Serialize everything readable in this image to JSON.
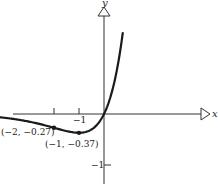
{
  "chart_data": {
    "type": "line",
    "title": "",
    "function": "y = x e^x",
    "xlabel": "x",
    "ylabel": "y",
    "x_ticks": [
      {
        "value": -2,
        "label": ""
      },
      {
        "value": -1,
        "label": "−1"
      }
    ],
    "y_ticks": [
      {
        "value": -1,
        "label": "−1"
      }
    ],
    "xlim": [
      -4.2,
      4.4
    ],
    "ylim": [
      -1.4,
      2.2
    ],
    "grid": false,
    "series": [
      {
        "name": "y = x e^x",
        "x": [
          -4.2,
          -4,
          -3.5,
          -3,
          -2.5,
          -2,
          -1.5,
          -1,
          -0.5,
          0,
          0.25,
          0.5,
          0.75
        ],
        "y": [
          -0.063,
          -0.073,
          -0.106,
          -0.149,
          -0.205,
          -0.271,
          -0.335,
          -0.368,
          -0.303,
          0,
          0.321,
          0.824,
          1.588
        ]
      }
    ],
    "annotations": [
      {
        "x": -2,
        "y": -0.27,
        "text": "(−2, −0.27)"
      },
      {
        "x": -1,
        "y": -0.37,
        "text": "(−1, −0.37)"
      }
    ]
  }
}
